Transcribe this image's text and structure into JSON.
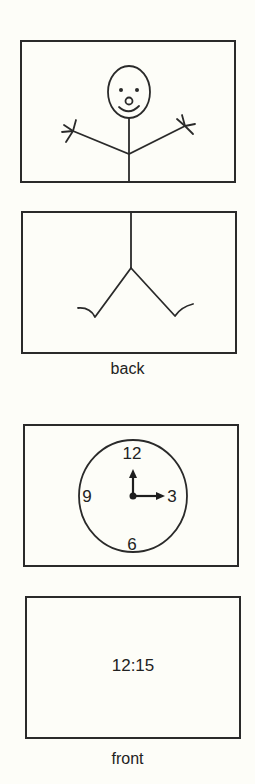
{
  "figure": {
    "panels": [
      {
        "id": "panel-1",
        "content": "stick-figure-upper-body",
        "description": "smiling face with arms raised"
      },
      {
        "id": "panel-2",
        "content": "stick-figure-lower-body",
        "caption": "back"
      },
      {
        "id": "panel-3",
        "content": "analog-clock",
        "clock": {
          "numerals": [
            "12",
            "3",
            "6",
            "9"
          ],
          "time_shown": "3:00"
        }
      },
      {
        "id": "panel-4",
        "content": "digital-time",
        "time_text": "12:15",
        "caption": "front"
      }
    ],
    "captions": {
      "back": "back",
      "front": "front"
    }
  },
  "colors": {
    "background": "#fdfdf8",
    "ink": "#2a2a2a"
  }
}
